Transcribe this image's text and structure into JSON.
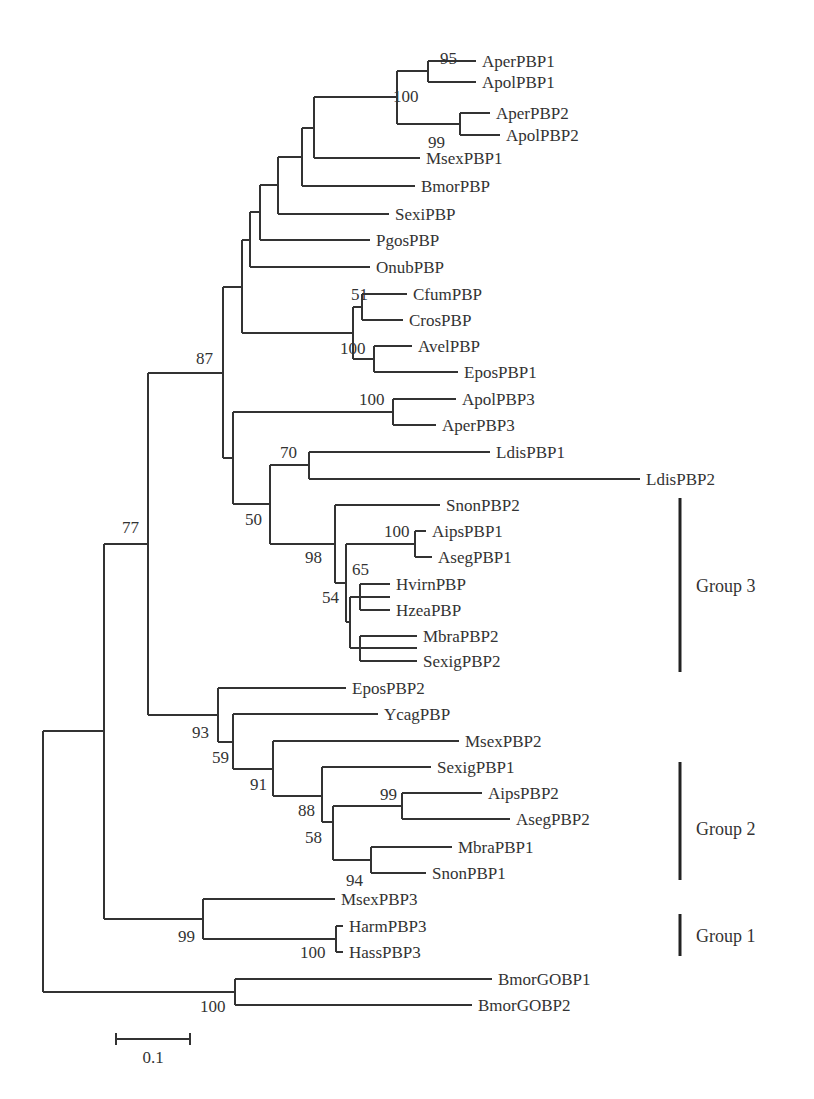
{
  "figure": {
    "type": "phylogenetic_tree",
    "scale_bar": {
      "label": "0.1",
      "x1": 116,
      "x2": 190,
      "y": 1039
    }
  },
  "leaves": [
    {
      "name": "AperPBP1",
      "x": 476,
      "y": 61
    },
    {
      "name": "ApolPBP1",
      "x": 476,
      "y": 82
    },
    {
      "name": "AperPBP2",
      "x": 490,
      "y": 113
    },
    {
      "name": "ApolPBP2",
      "x": 500,
      "y": 135
    },
    {
      "name": "MsexPBP1",
      "x": 420,
      "y": 158
    },
    {
      "name": "BmorPBP",
      "x": 415,
      "y": 186
    },
    {
      "name": "SexiPBP",
      "x": 389,
      "y": 214
    },
    {
      "name": "PgosPBP",
      "x": 370,
      "y": 240
    },
    {
      "name": "OnubPBP",
      "x": 370,
      "y": 267
    },
    {
      "name": "CfumPBP",
      "x": 407,
      "y": 294
    },
    {
      "name": "CrosPBP",
      "x": 403,
      "y": 320
    },
    {
      "name": "AvelPBP",
      "x": 412,
      "y": 346
    },
    {
      "name": "EposPBP1",
      "x": 458,
      "y": 372
    },
    {
      "name": "ApolPBP3",
      "x": 456,
      "y": 399
    },
    {
      "name": "AperPBP3",
      "x": 436,
      "y": 425
    },
    {
      "name": "LdisPBP1",
      "x": 490,
      "y": 452
    },
    {
      "name": "LdisPBP2",
      "x": 640,
      "y": 479
    },
    {
      "name": "SnonPBP2",
      "x": 440,
      "y": 505
    },
    {
      "name": "AipsPBP1",
      "x": 426,
      "y": 531
    },
    {
      "name": "AsegPBP1",
      "x": 432,
      "y": 557
    },
    {
      "name": "HvirnPBP",
      "x": 390,
      "y": 584
    },
    {
      "name": "HzeaPBP",
      "x": 390,
      "y": 610
    },
    {
      "name": "MbraPBP2",
      "x": 417,
      "y": 636
    },
    {
      "name": "SexigPBP2",
      "x": 417,
      "y": 661
    },
    {
      "name": "EposPBP2",
      "x": 346,
      "y": 688
    },
    {
      "name": "YcagPBP",
      "x": 378,
      "y": 714
    },
    {
      "name": "MsexPBP2",
      "x": 459,
      "y": 741
    },
    {
      "name": "SexigPBP1",
      "x": 431,
      "y": 767
    },
    {
      "name": "AipsPBP2",
      "x": 482,
      "y": 793
    },
    {
      "name": "AsegPBP2",
      "x": 510,
      "y": 819
    },
    {
      "name": "MbraPBP1",
      "x": 452,
      "y": 847
    },
    {
      "name": "SnonPBP1",
      "x": 426,
      "y": 873
    },
    {
      "name": "MsexPBP3",
      "x": 335,
      "y": 899
    },
    {
      "name": "HarmPBP3",
      "x": 343,
      "y": 926
    },
    {
      "name": "HassPBP3",
      "x": 343,
      "y": 952
    },
    {
      "name": "BmorGOBP1",
      "x": 492,
      "y": 979
    },
    {
      "name": "BmorGOBP2",
      "x": 472,
      "y": 1005
    }
  ],
  "bootstrap_values": [
    {
      "value": "95",
      "x": 440,
      "y": 64
    },
    {
      "value": "100",
      "x": 393,
      "y": 102
    },
    {
      "value": "99",
      "x": 428,
      "y": 148
    },
    {
      "value": "51",
      "x": 351,
      "y": 300
    },
    {
      "value": "100",
      "x": 340,
      "y": 354
    },
    {
      "value": "87",
      "x": 196,
      "y": 364
    },
    {
      "value": "100",
      "x": 359,
      "y": 405
    },
    {
      "value": "70",
      "x": 280,
      "y": 458
    },
    {
      "value": "50",
      "x": 245,
      "y": 525
    },
    {
      "value": "100",
      "x": 384,
      "y": 537
    },
    {
      "value": "98",
      "x": 305,
      "y": 563
    },
    {
      "value": "65",
      "x": 352,
      "y": 575
    },
    {
      "value": "54",
      "x": 322,
      "y": 603
    },
    {
      "value": "77",
      "x": 122,
      "y": 533
    },
    {
      "value": "93",
      "x": 192,
      "y": 738
    },
    {
      "value": "59",
      "x": 212,
      "y": 763
    },
    {
      "value": "91",
      "x": 250,
      "y": 790
    },
    {
      "value": "88",
      "x": 298,
      "y": 816
    },
    {
      "value": "99",
      "x": 380,
      "y": 800
    },
    {
      "value": "58",
      "x": 305,
      "y": 843
    },
    {
      "value": "94",
      "x": 346,
      "y": 886
    },
    {
      "value": "99",
      "x": 178,
      "y": 942
    },
    {
      "value": "100",
      "x": 300,
      "y": 958
    },
    {
      "value": "100",
      "x": 200,
      "y": 1012
    }
  ],
  "branches": [
    "M428,61 L476,61",
    "M428,61 L428,82",
    "M428,82 L476,82",
    "M397,71 L428,71",
    "M460,113 L490,113",
    "M460,113 L460,135",
    "M460,135 L500,135",
    "M397,124 L460,124",
    "M397,71 L397,124",
    "M314,97 L397,97",
    "M314,97 L314,158",
    "M314,158 L420,158",
    "M302,128 L314,128",
    "M302,128 L302,186",
    "M302,186 L415,186",
    "M278,157 L302,157",
    "M278,157 L278,214",
    "M278,214 L389,214",
    "M260,185 L278,185",
    "M260,185 L260,240",
    "M260,240 L370,240",
    "M250,212 L260,212",
    "M250,212 L250,267",
    "M250,267 L370,267",
    "M362,294 L407,294",
    "M362,294 L362,320",
    "M362,320 L403,320",
    "M353,307 L362,307",
    "M374,346 L412,346",
    "M374,346 L374,372",
    "M374,372 L458,372",
    "M353,359 L374,359",
    "M353,307 L353,359",
    "M242,240 L250,240",
    "M242,240 L242,333",
    "M242,333 L353,333",
    "M223,287 L242,287",
    "M393,399 L456,399",
    "M393,399 L393,425",
    "M393,425 L436,425",
    "M233,412 L393,412",
    "M309,452 L490,452",
    "M309,452 L309,479",
    "M309,479 L640,479",
    "M270,465 L309,465",
    "M415,531 L426,531",
    "M415,531 L415,557",
    "M415,557 L432,557",
    "M360,597 L390,597",
    "M360,584 L390,584",
    "M360,584 L360,610",
    "M360,610 L390,610",
    "M360,648 L417,648",
    "M360,636 L417,636",
    "M360,636 L360,661",
    "M360,661 L417,661",
    "M350,597 L360,597",
    "M350,597 L350,648",
    "M350,648 L360,648",
    "M346,544 L415,544",
    "M346,544 L346,622",
    "M346,622 L350,622",
    "M335,505 L440,505",
    "M335,505 L335,583",
    "M335,583 L346,583",
    "M270,544 L335,544",
    "M270,465 L270,544",
    "M233,504 L270,504",
    "M233,412 L233,504",
    "M223,287 L223,458",
    "M223,458 L233,458",
    "M148,373 L223,373",
    "M218,688 L346,688",
    "M218,688 L218,742",
    "M233,714 L378,714",
    "M233,714 L233,769",
    "M273,741 L459,741",
    "M273,741 L273,796",
    "M322,767 L431,767",
    "M322,767 L322,822",
    "M402,793 L482,793",
    "M402,793 L402,819",
    "M402,819 L510,819",
    "M333,806 L402,806",
    "M333,806 L333,860",
    "M371,847 L452,847",
    "M371,847 L371,873",
    "M371,873 L426,873",
    "M333,860 L371,860",
    "M322,822 L333,822",
    "M273,796 L322,796",
    "M233,769 L273,769",
    "M218,742 L233,742",
    "M148,715 L218,715",
    "M148,373 L148,715",
    "M104,544 L148,544",
    "M203,899 L335,899",
    "M203,899 L203,939",
    "M336,926 L343,926",
    "M336,926 L336,952",
    "M336,952 L343,952",
    "M203,939 L336,939",
    "M104,919 L203,919",
    "M104,544 L104,919",
    "M43,731 L104,731",
    "M235,979 L492,979",
    "M235,979 L235,1005",
    "M235,1005 L472,1005",
    "M43,992 L235,992",
    "M43,731 L43,992"
  ],
  "groups": [
    {
      "label": "Group 3",
      "bar_x": 680,
      "y1": 498,
      "y2": 672,
      "label_x": 696,
      "label_y": 592
    },
    {
      "label": "Group 2",
      "bar_x": 680,
      "y1": 762,
      "y2": 880,
      "label_x": 696,
      "label_y": 835
    },
    {
      "label": "Group 1",
      "bar_x": 680,
      "y1": 914,
      "y2": 956,
      "label_x": 696,
      "label_y": 942
    }
  ],
  "chart_data": {
    "type": "phylogenetic_tree",
    "title": "",
    "scale_bar": "0.1",
    "groups": [
      {
        "name": "Group 3",
        "members": [
          "SnonPBP2",
          "AipsPBP1",
          "AsegPBP1",
          "HvirnPBP",
          "HzeaPBP",
          "MbraPBP2",
          "SexigPBP2"
        ]
      },
      {
        "name": "Group 2",
        "members": [
          "SexigPBP1",
          "AipsPBP2",
          "AsegPBP2",
          "MbraPBP1",
          "SnonPBP1"
        ]
      },
      {
        "name": "Group 1",
        "members": [
          "MsexPBP3",
          "HarmPBP3",
          "HassPBP3"
        ]
      }
    ],
    "leaf_order": [
      "AperPBP1",
      "ApolPBP1",
      "AperPBP2",
      "ApolPBP2",
      "MsexPBP1",
      "BmorPBP",
      "SexiPBP",
      "PgosPBP",
      "OnubPBP",
      "CfumPBP",
      "CrosPBP",
      "AvelPBP",
      "EposPBP1",
      "ApolPBP3",
      "AperPBP3",
      "LdisPBP1",
      "LdisPBP2",
      "SnonPBP2",
      "AipsPBP1",
      "AsegPBP1",
      "HvirnPBP",
      "HzeaPBP",
      "MbraPBP2",
      "SexigPBP2",
      "EposPBP2",
      "YcagPBP",
      "MsexPBP2",
      "SexigPBP1",
      "AipsPBP2",
      "AsegPBP2",
      "MbraPBP1",
      "SnonPBP1",
      "MsexPBP3",
      "HarmPBP3",
      "HassPBP3",
      "BmorGOBP1",
      "BmorGOBP2"
    ],
    "bootstrap_support": [
      "95",
      "100",
      "99",
      "51",
      "100",
      "87",
      "100",
      "70",
      "50",
      "100",
      "98",
      "65",
      "54",
      "77",
      "93",
      "59",
      "91",
      "88",
      "99",
      "58",
      "94",
      "99",
      "100",
      "100"
    ]
  }
}
